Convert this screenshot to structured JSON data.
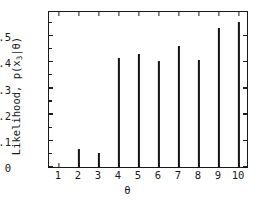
{
  "chart_data": {
    "type": "bar",
    "title": "",
    "xlabel": "θ",
    "ylabel": "Likelihood, p(x₃|θ)",
    "ylabel_parts": {
      "prefix": "Likelihood, p(x",
      "sub": "3",
      "suffix": "|θ)"
    },
    "categories": [
      "1",
      "2",
      "3",
      "4",
      "5",
      "6",
      "7",
      "8",
      "9",
      "10"
    ],
    "values": [
      0.0,
      0.067,
      0.053,
      0.417,
      0.432,
      0.407,
      0.461,
      0.41,
      0.531,
      0.556
    ],
    "xlim": [
      0.5,
      10.5
    ],
    "ylim": [
      0,
      0.6
    ],
    "yticks": [
      0,
      0.1,
      0.2,
      0.3,
      0.4,
      0.5
    ],
    "ytick_labels": [
      "0",
      "0.1",
      "0.2",
      "0.3",
      "0.4",
      "0.5"
    ],
    "xticks": [
      1,
      2,
      3,
      4,
      5,
      6,
      7,
      8,
      9,
      10
    ],
    "xtick_labels": [
      "1",
      "2",
      "3",
      "4",
      "5",
      "6",
      "7",
      "8",
      "9",
      "10"
    ],
    "grid": false,
    "legend": null,
    "bar_color": "#141414",
    "axis_color": "#1a1a1a",
    "background": "#ffffff"
  }
}
